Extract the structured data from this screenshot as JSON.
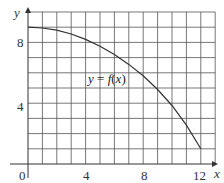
{
  "chart_data": {
    "type": "line",
    "title": "",
    "xlabel": "x",
    "ylabel": "y",
    "xlim": [
      0,
      13
    ],
    "ylim": [
      0,
      10
    ],
    "grid": true,
    "x_ticks": [
      0,
      4,
      8,
      12
    ],
    "y_ticks": [
      4,
      8
    ],
    "x_tick_labels": [
      "0",
      "4",
      "8",
      "12"
    ],
    "y_tick_labels": [
      "4",
      "8"
    ],
    "annotations": [
      {
        "text": "y = f(x)",
        "x": 7.2,
        "y": 5.5
      }
    ],
    "series": [
      {
        "name": "y = f(x)",
        "x": [
          0,
          1,
          2,
          3,
          4,
          5,
          6,
          7,
          8,
          9,
          10,
          11,
          12
        ],
        "y": [
          9,
          8.95,
          8.8,
          8.55,
          8.2,
          7.75,
          7.2,
          6.55,
          5.8,
          4.9,
          3.85,
          2.55,
          1
        ]
      }
    ]
  },
  "labels": {
    "x_axis": "x",
    "y_axis": "y",
    "origin": "0",
    "x4": "4",
    "x8": "8",
    "x12": "12",
    "y4": "4",
    "y8": "8",
    "curve": "y = f(x)"
  }
}
